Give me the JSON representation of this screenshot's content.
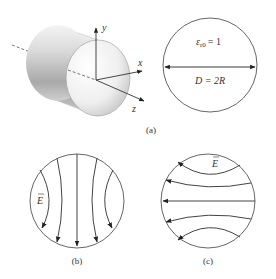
{
  "figure": {
    "panel_a": {
      "caption": "(a)",
      "axes": {
        "x": "x",
        "y": "y",
        "z": "z"
      },
      "cross_section": {
        "permittivity_symbol": "ε",
        "permittivity_subscript": "r0",
        "permittivity_value": "= 1",
        "diameter_label": "D = 2R"
      }
    },
    "panel_b": {
      "caption": "(b)",
      "field_label": "E",
      "field_direction": "downward (vertical)",
      "field_line_count": 5
    },
    "panel_c": {
      "caption": "(c)",
      "field_label": "E",
      "field_direction": "leftward (horizontal)",
      "field_line_count": 5
    }
  }
}
